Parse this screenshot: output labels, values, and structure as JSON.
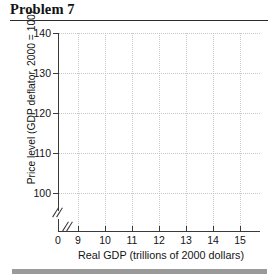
{
  "header": {
    "title": "Problem 7"
  },
  "chart_data": {
    "type": "scatter",
    "title": "Problem 7",
    "xlabel": "Real GDP (trillions of 2000 dollars)",
    "ylabel": "Price level (GDP deflator, 2000 = 100)",
    "xlim": [
      9,
      15
    ],
    "ylim": [
      100,
      140
    ],
    "x_ticks": [
      {
        "label": "0",
        "value": 0,
        "pos_px": 58
      },
      {
        "label": "9",
        "value": 9,
        "pos_px": 78
      },
      {
        "label": "10",
        "value": 10,
        "pos_px": 105
      },
      {
        "label": "11",
        "value": 11,
        "pos_px": 132
      },
      {
        "label": "12",
        "value": 12,
        "pos_px": 159
      },
      {
        "label": "13",
        "value": 13,
        "pos_px": 186
      },
      {
        "label": "14",
        "value": 14,
        "pos_px": 213
      },
      {
        "label": "15",
        "value": 15,
        "pos_px": 240
      }
    ],
    "y_ticks": [
      {
        "label": "140",
        "value": 140,
        "pos_px": 33
      },
      {
        "label": "130",
        "value": 130,
        "pos_px": 73
      },
      {
        "label": "120",
        "value": 120,
        "pos_px": 113
      },
      {
        "label": "110",
        "value": 110,
        "pos_px": 153
      },
      {
        "label": "100",
        "value": 100,
        "pos_px": 193
      }
    ],
    "grid": true,
    "grid_style": "dotted",
    "axis_break_x": true,
    "axis_break_y": true,
    "series": [],
    "values": [],
    "legend": null
  },
  "style": {
    "grid_color": "#c9c9c9",
    "axis_color": "#3a3a3a",
    "text_color": "#141414",
    "rule_color": "#2b2b2b",
    "bottom_bar_color": "#9a9a9a",
    "background": "#ffffff"
  }
}
